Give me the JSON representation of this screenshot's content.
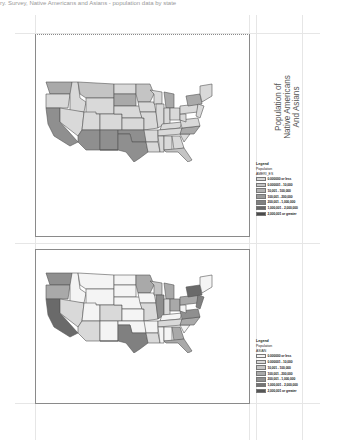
{
  "header": {
    "clipped_caption": "ry. Survey, Native Americans and Asians - population data by state"
  },
  "title": {
    "line1": "Population of",
    "line2": "Native Americans",
    "line3": "And Asians"
  },
  "colors": {
    "ramp": [
      "#f4f4f4",
      "#d9d9d9",
      "#c4c4c4",
      "#a9a9a9",
      "#8f8f8f",
      "#747474",
      "#555555"
    ],
    "frame": "#8a8a8a",
    "guide": "#e6e6e6"
  },
  "maps": [
    {
      "name": "native-americans-map",
      "field": "AMERI_ES",
      "legend": {
        "title": "Legend",
        "subtitle": "Population",
        "field": "AMERI_ES",
        "classes": [
          {
            "label": "0.000000 or less"
          },
          {
            "label": "0.000001 - 10,000"
          },
          {
            "label": "10,001 - 100,000"
          },
          {
            "label": "100,001 - 200,000"
          },
          {
            "label": "200,001 - 1,000,000"
          },
          {
            "label": "1,000,001 - 2,000,000"
          },
          {
            "label": "2,000,001 or greater"
          }
        ]
      }
    },
    {
      "name": "asians-map",
      "field": "ASIAN",
      "legend": {
        "title": "Legend",
        "subtitle": "Population",
        "field": "ASIAN",
        "classes": [
          {
            "label": "0.000000 or less"
          },
          {
            "label": "0.000001 - 10,000"
          },
          {
            "label": "10,001 - 100,000"
          },
          {
            "label": "100,001 - 200,000"
          },
          {
            "label": "200,001 - 1,000,000"
          },
          {
            "label": "1,000,001 - 2,000,000"
          },
          {
            "label": "2,000,001 or greater"
          }
        ]
      }
    }
  ]
}
